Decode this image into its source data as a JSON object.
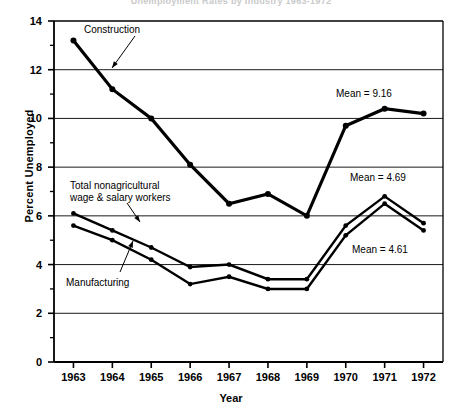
{
  "figure": {
    "clipped_title": "Unemployment Rates by Industry 1963-1972",
    "ylabel": "Percent Unemployed",
    "xlabel": "Year"
  },
  "chart_data": {
    "type": "line",
    "title": "",
    "xlabel": "Year",
    "ylabel": "Percent Unemployed",
    "categories": [
      "1963",
      "1964",
      "1965",
      "1966",
      "1967",
      "1968",
      "1969",
      "1970",
      "1971",
      "1972"
    ],
    "x": [
      1963,
      1964,
      1965,
      1966,
      1967,
      1968,
      1969,
      1970,
      1971,
      1972
    ],
    "xlim": [
      1962.5,
      1972.5
    ],
    "ylim": [
      0,
      14
    ],
    "yticks": [
      0,
      2,
      4,
      6,
      8,
      10,
      12,
      14
    ],
    "yminorticks": [
      1,
      3,
      5,
      7,
      9,
      11,
      13
    ],
    "grid": "horizontal-major",
    "legend": "none-inline-labels",
    "series": [
      {
        "name": "Construction",
        "values": [
          13.2,
          11.2,
          10.0,
          8.1,
          6.5,
          6.9,
          6.0,
          9.7,
          10.4,
          10.2
        ],
        "mean": 9.16,
        "mean_label": "Mean = 9.16",
        "color": "#000000",
        "linewidth": 3.2
      },
      {
        "name": "Total nonagricultural wage & salary workers",
        "values": [
          6.1,
          5.4,
          4.7,
          3.9,
          4.0,
          3.4,
          3.4,
          5.6,
          6.8,
          5.7
        ],
        "mean": 4.69,
        "mean_label": "Mean = 4.69",
        "color": "#000000",
        "linewidth": 2.4
      },
      {
        "name": "Manufacturing",
        "values": [
          5.6,
          5.0,
          4.2,
          3.2,
          3.5,
          3.0,
          3.0,
          5.2,
          6.5,
          5.4
        ],
        "mean": 4.61,
        "mean_label": "Mean = 4.61",
        "color": "#000000",
        "linewidth": 2.4
      }
    ],
    "annotations": [
      {
        "id": "construction",
        "text": "Construction"
      },
      {
        "id": "total",
        "text": "Total nonagricultural\nwage & salary workers"
      },
      {
        "id": "manufacturing",
        "text": "Manufacturing"
      },
      {
        "id": "mean-construction",
        "text": "Mean = 9.16"
      },
      {
        "id": "mean-total",
        "text": "Mean = 4.69"
      },
      {
        "id": "mean-manufacturing",
        "text": "Mean = 4.61"
      }
    ]
  },
  "axis": {
    "yticklabels": [
      "14",
      "12",
      "10",
      "8",
      "6",
      "4",
      "2",
      "0"
    ],
    "xticklabels": [
      "1963",
      "1964",
      "1965",
      "1966",
      "1967",
      "1968",
      "1969",
      "1970",
      "1971",
      "1972"
    ]
  }
}
